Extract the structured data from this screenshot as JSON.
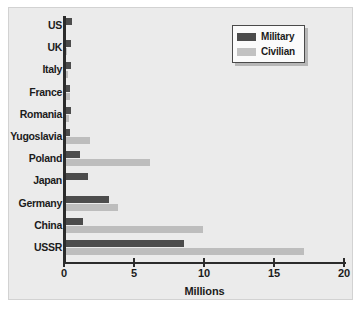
{
  "chart_data": {
    "type": "bar",
    "orientation": "horizontal",
    "title": "",
    "xlabel": "Millions",
    "ylabel": "",
    "xlim": [
      0,
      20
    ],
    "xticks": [
      0,
      5,
      10,
      15,
      20
    ],
    "xtick_labels": [
      "0",
      "5",
      "10",
      "15",
      "20"
    ],
    "grid": false,
    "legend_position": "top-right",
    "categories": [
      "US",
      "UK",
      "Italy",
      "France",
      "Romania",
      "Yugoslavia",
      "Poland",
      "Japan",
      "Germany",
      "China",
      "USSR"
    ],
    "series": [
      {
        "name": "Military",
        "color": "#4c4c4c",
        "values": [
          0.42,
          0.38,
          0.33,
          0.25,
          0.35,
          0.3,
          1.0,
          1.6,
          3.1,
          1.2,
          8.4
        ]
      },
      {
        "name": "Civilian",
        "color": "#bdbdbd",
        "values": [
          0.0,
          0.07,
          0.15,
          0.3,
          0.2,
          1.7,
          6.0,
          0.0,
          3.7,
          9.8,
          17.0
        ]
      }
    ]
  },
  "axis": {
    "x_title": "Millions",
    "tick_labels": [
      "0",
      "5",
      "10",
      "15",
      "20"
    ]
  },
  "legend": {
    "items": [
      {
        "label": "Military",
        "color": "#4c4c4c"
      },
      {
        "label": "Civilian",
        "color": "#bdbdbd"
      }
    ]
  },
  "colors": {
    "panel_background": "#ebebeb",
    "figure_background": "#ffffff",
    "axis": "#2b2b2b",
    "military": "#4c4c4c",
    "civilian": "#bdbdbd"
  }
}
